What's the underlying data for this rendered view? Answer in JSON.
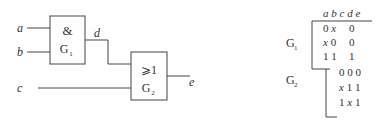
{
  "circuit": {
    "inputs": [
      {
        "name": "a"
      },
      {
        "name": "b"
      },
      {
        "name": "c"
      }
    ],
    "intermediate": {
      "name": "d"
    },
    "output": {
      "name": "e"
    },
    "gates": [
      {
        "id": "G1",
        "symbol": "&",
        "label_main": "G",
        "label_sub": "1",
        "type": "AND",
        "inputs": [
          "a",
          "b"
        ],
        "output": "d"
      },
      {
        "id": "G2",
        "symbol": "⩾1",
        "label_main": "G",
        "label_sub": "2",
        "type": "OR",
        "inputs": [
          "d",
          "c"
        ],
        "output": "e"
      }
    ]
  },
  "table": {
    "header": "a b c d e",
    "columns": [
      "a",
      "b",
      "c",
      "d",
      "e"
    ],
    "groups": [
      {
        "label_main": "G",
        "label_sub": "1",
        "rows": [
          {
            "text": "0 x   0",
            "a": "0",
            "b": "x",
            "d": "0"
          },
          {
            "text": "x 0   0",
            "a": "x",
            "b": "0",
            "d": "0"
          },
          {
            "text": "1 1   1",
            "a": "1",
            "b": "1",
            "d": "1"
          }
        ]
      },
      {
        "label_main": "G",
        "label_sub": "2",
        "rows": [
          {
            "text": "0 0 0",
            "c": "0",
            "d": "0",
            "e": "0"
          },
          {
            "text": "x 1 1",
            "c": "x",
            "d": "1",
            "e": "1"
          },
          {
            "text": "1 x 1",
            "c": "1",
            "d": "x",
            "e": "1"
          }
        ]
      }
    ]
  }
}
